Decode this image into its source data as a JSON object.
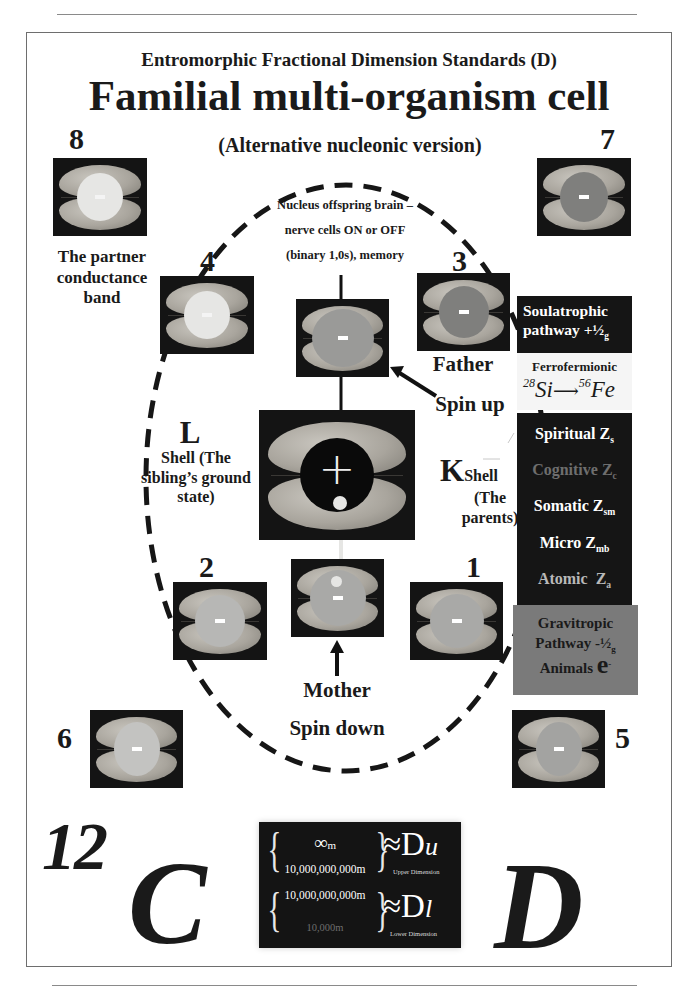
{
  "header": {
    "subtitle": "Entromorphic Fractional Dimension Standards (D)",
    "title": "Familial multi-organism cell",
    "version_note": "(Alternative nucleonic version)"
  },
  "colors": {
    "brain_bg": "#141414",
    "core_white": "#e6e6e4",
    "core_gray": "#a8a8a6",
    "core_dark": "#7f7f7d",
    "core_black": "#0a0a0a",
    "gravitropic_panel": "#7a7a7a",
    "panel_dark": "#151515"
  },
  "positions": [
    {
      "number": "8",
      "core": "white",
      "symbol": "-"
    },
    {
      "number": "7",
      "core": "dark",
      "symbol": "-"
    },
    {
      "number": "4",
      "core": "white",
      "symbol": "-"
    },
    {
      "number": "3",
      "core": "dark",
      "symbol": "-"
    },
    {
      "number": "2",
      "core": "light",
      "symbol": "-"
    },
    {
      "number": "1",
      "core": "light",
      "symbol": "-"
    },
    {
      "number": "6",
      "core": "light",
      "symbol": "-"
    },
    {
      "number": "5",
      "core": "light",
      "symbol": "-"
    }
  ],
  "nucleus": {
    "symbol": "+",
    "top_brain_symbol": "-",
    "mother_symbol": "-"
  },
  "labels": {
    "partner": [
      "The partner",
      "conductance",
      "band"
    ],
    "nucleus": [
      "Nucleus offspring brain –",
      "nerve cells ON or OFF",
      "(binary 1,0s), memory"
    ],
    "father": "Father",
    "spin_up": "Spin up",
    "l_shell_letter": "L",
    "l_shell": [
      "Shell (The",
      "sibling’s ground",
      "state)"
    ],
    "k_shell_letter": "K",
    "k_shell_word": "Shell",
    "k_shell": [
      "(The",
      "parents)"
    ],
    "mother": "Mother",
    "spin_down": "Spin down"
  },
  "pathways": {
    "soulatrophic": {
      "line1": "Soulatrophic",
      "line2": "pathway +",
      "fraction": "½",
      "sub": "g"
    },
    "ferrofermionic": {
      "title": "Ferrofermionic",
      "from_mass": "28",
      "from": "Si",
      "to_mass": "56",
      "to": "Fe"
    },
    "z_levels": [
      {
        "name": "Spiritual Z",
        "sub": "s",
        "color": "#ffffff"
      },
      {
        "name": "Cognitive Z",
        "sub": "c",
        "color": "#6e6e6e"
      },
      {
        "name": "Somatic Z",
        "sub": "sm",
        "color": "#ffffff"
      },
      {
        "name": "Micro Z",
        "sub": "mb",
        "color": "#ffffff"
      },
      {
        "name": "Atomic  Z",
        "sub": "a",
        "color": "#b8b8b8"
      }
    ],
    "particles": {
      "p": "p",
      "p_sup": "+",
      "n": "n",
      "n_sup": "0",
      "e": "e",
      "e_sup": "−"
    },
    "gravitropic": {
      "line1": "Gravitropic",
      "line2": "Pathway -",
      "fraction": "½",
      "sub": "g",
      "line3": "Animals",
      "electron": "e",
      "electron_sup": "-"
    }
  },
  "dimension_box": {
    "upper": {
      "top": "∞",
      "top_unit": "m",
      "bottom": "10,000,000,000m",
      "symbol": "≈D",
      "sub": "u",
      "caption": "Upper Dimension"
    },
    "lower": {
      "top": "10,000,000,000m",
      "bottom": "10,000m",
      "symbol": "≈D",
      "sub": "l",
      "caption": "Lower Dimension"
    }
  },
  "element_labels": {
    "carbon_mass": "12",
    "carbon": "C",
    "d_letter": "D"
  }
}
